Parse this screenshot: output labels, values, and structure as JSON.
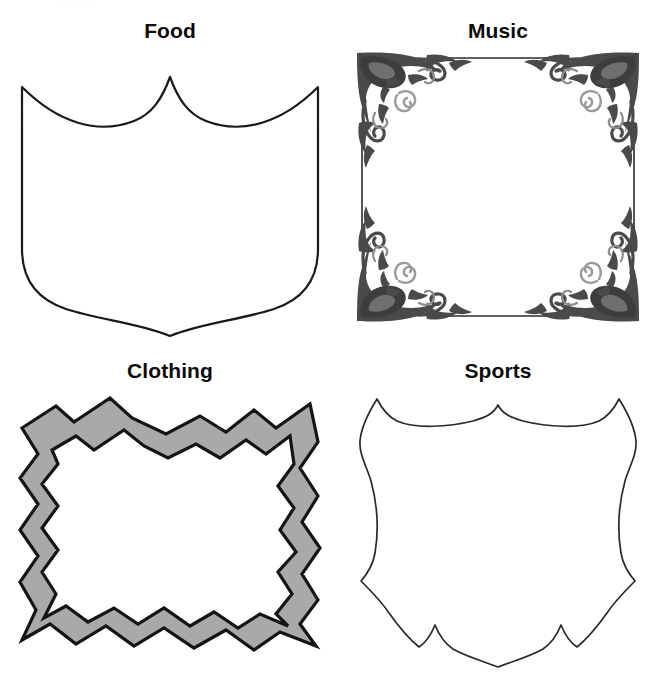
{
  "page": {
    "background_color": "#ffffff",
    "top_artifact_text": "·        ·                 ·      ·     ·",
    "layout": "2x2 grid of labeled frame/shield clip-art outlines"
  },
  "cells": [
    {
      "id": "food",
      "label": "Food",
      "shape_name": "heraldic-shield-outline",
      "fill_color": "#ffffff",
      "stroke_color": "#1a1a1a",
      "stroke_width": 2.2
    },
    {
      "id": "music",
      "label": "Music",
      "shape_name": "ornate-scrollwork-corner-frame",
      "fill_color": "#ffffff",
      "stroke_color": "#2b2b2b",
      "ornament_color": "#4a4a4a",
      "stroke_width": 1.4
    },
    {
      "id": "clothing",
      "label": "Clothing",
      "shape_name": "zigzag-torn-edge-band-frame",
      "fill_color": "#a9a9a9",
      "stroke_color": "#141414",
      "stroke_width": 3.2
    },
    {
      "id": "sports",
      "label": "Sports",
      "shape_name": "notched-heraldic-shield-outline",
      "fill_color": "#ffffff",
      "stroke_color": "#2a2a2a",
      "stroke_width": 1.5
    }
  ]
}
